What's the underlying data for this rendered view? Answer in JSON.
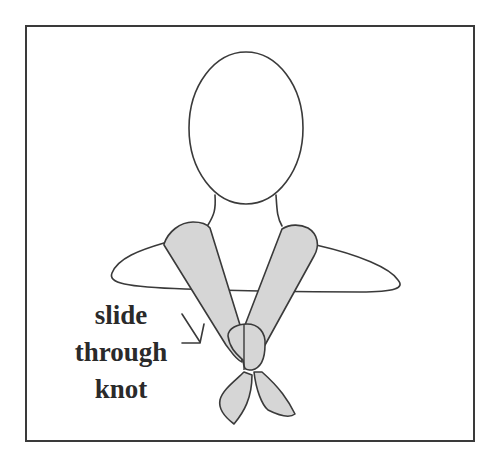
{
  "figure": {
    "label_lines": [
      "slide",
      "through",
      "knot"
    ],
    "colors": {
      "outline": "#3a3a3a",
      "scarf_fill": "#d6d6d6",
      "background": "#ffffff",
      "text": "#2a2a2a"
    },
    "icons": [
      "arrow-pointer-icon"
    ]
  }
}
